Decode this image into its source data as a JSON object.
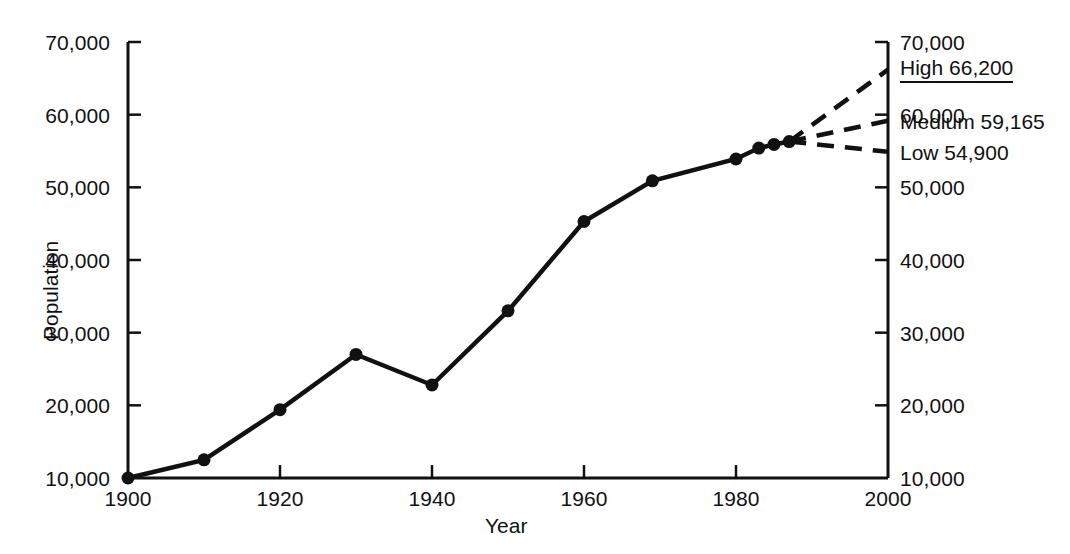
{
  "chart_data": {
    "type": "line",
    "title": "",
    "xlabel": "Year",
    "ylabel": "Population",
    "xlim": [
      1900,
      2000
    ],
    "ylim": [
      10000,
      70000
    ],
    "grid": false,
    "legend": "none",
    "x_ticks": [
      "1900",
      "1920",
      "1940",
      "1960",
      "1980",
      "2000"
    ],
    "x_tick_values": [
      1900,
      1920,
      1940,
      1960,
      1980,
      2000
    ],
    "y_ticks_left": [
      "70,000",
      "60,000",
      "50,000",
      "40,000",
      "30,000",
      "20,000",
      "10,000"
    ],
    "y_tick_values": [
      70000,
      60000,
      50000,
      40000,
      30000,
      20000,
      10000
    ],
    "y_ticks_right": [
      "70,000",
      "60,000",
      "50,000",
      "40,000",
      "30,000",
      "20,000",
      "10,000"
    ],
    "series": [
      {
        "name": "Historical population",
        "style": "solid",
        "markers": true,
        "x": [
          1900,
          1910,
          1920,
          1930,
          1940,
          1950,
          1960,
          1969,
          1980,
          1983,
          1985,
          1987
        ],
        "values": [
          10000,
          12500,
          19400,
          27000,
          22800,
          33000,
          45300,
          50900,
          53900,
          55400,
          55900,
          56300
        ]
      },
      {
        "name": "High projection",
        "style": "dashed",
        "markers": false,
        "x": [
          1987,
          2000
        ],
        "values": [
          56300,
          66200
        ]
      },
      {
        "name": "Medium projection",
        "style": "dashed",
        "markers": false,
        "x": [
          1987,
          2000
        ],
        "values": [
          56300,
          59165
        ]
      },
      {
        "name": "Low projection",
        "style": "dashed",
        "markers": false,
        "x": [
          1987,
          2000
        ],
        "values": [
          56300,
          54900
        ]
      }
    ],
    "annotations": [
      {
        "key": "high",
        "label": "High 66,200",
        "value": 66200,
        "underlined": true
      },
      {
        "key": "medium",
        "label": "Medium 59,165",
        "value": 59165,
        "underlined": false
      },
      {
        "key": "low",
        "label": "Low 54,900",
        "value": 54900,
        "underlined": false
      }
    ]
  },
  "style": {
    "line_color": "#111111",
    "axis_color": "#111111",
    "background": "#ffffff"
  }
}
